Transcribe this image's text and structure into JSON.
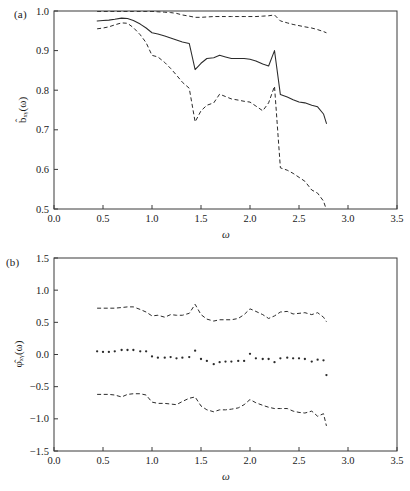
{
  "figure": {
    "panel_a_tag": "(a)",
    "panel_b_tag": "(b)",
    "xlabel": "ω",
    "ylabel_a": "b̂ₓᵧ(ω)",
    "ylabel_b": "φ̂ₓᵧ(ω)",
    "line_color": "#2b2b2b",
    "frame_color": "#3a3a3a",
    "background": "#ffffff"
  },
  "chart_data": [
    {
      "type": "line",
      "panel": "(a)",
      "title": "",
      "xlabel": "ω",
      "ylabel": "b̂_xy(ω)",
      "xlim": [
        0.0,
        3.5
      ],
      "ylim": [
        0.5,
        1.0
      ],
      "xticks": [
        0.0,
        0.5,
        1.0,
        1.5,
        2.0,
        2.5,
        3.0,
        3.5
      ],
      "xticklabels": [
        "0.0",
        "0.5",
        "1.0",
        "1.5",
        "2.0",
        "2.5",
        "3.0",
        "3.5"
      ],
      "yticks": [
        0.5,
        0.6,
        0.7,
        0.8,
        0.9,
        1.0
      ],
      "yticklabels": [
        "0.5",
        "0.6",
        "0.7",
        "0.8",
        "0.9",
        "1.0"
      ],
      "grid": false,
      "legend": "none",
      "series": [
        {
          "name": "upper confidence band",
          "style": "dashed",
          "x": [
            0.44,
            0.5,
            0.56,
            0.62,
            0.69,
            0.75,
            0.81,
            0.88,
            0.94,
            1.0,
            1.06,
            1.13,
            1.19,
            1.25,
            1.31,
            1.38,
            1.44,
            1.5,
            1.56,
            1.63,
            1.69,
            1.75,
            1.81,
            1.88,
            1.94,
            2.0,
            2.06,
            2.13,
            2.19,
            2.25,
            2.31,
            2.38,
            2.44,
            2.5,
            2.56,
            2.63,
            2.69,
            2.75,
            2.78
          ],
          "y": [
            0.999,
            0.999,
            0.999,
            0.999,
            0.999,
            0.999,
            0.999,
            0.999,
            0.999,
            0.999,
            0.998,
            0.997,
            0.996,
            0.994,
            0.99,
            0.987,
            0.984,
            0.984,
            0.985,
            0.986,
            0.986,
            0.986,
            0.986,
            0.986,
            0.986,
            0.986,
            0.986,
            0.987,
            0.988,
            0.99,
            0.975,
            0.97,
            0.966,
            0.963,
            0.96,
            0.957,
            0.953,
            0.948,
            0.945
          ]
        },
        {
          "name": "point estimate",
          "style": "solid",
          "x": [
            0.44,
            0.5,
            0.56,
            0.62,
            0.69,
            0.75,
            0.81,
            0.88,
            0.94,
            1.0,
            1.06,
            1.13,
            1.19,
            1.25,
            1.31,
            1.38,
            1.44,
            1.5,
            1.56,
            1.63,
            1.69,
            1.75,
            1.81,
            1.88,
            1.94,
            2.0,
            2.06,
            2.13,
            2.19,
            2.25,
            2.31,
            2.38,
            2.44,
            2.5,
            2.56,
            2.63,
            2.69,
            2.75,
            2.78
          ],
          "y": [
            0.975,
            0.976,
            0.977,
            0.979,
            0.982,
            0.981,
            0.976,
            0.967,
            0.957,
            0.945,
            0.942,
            0.937,
            0.932,
            0.927,
            0.922,
            0.918,
            0.852,
            0.868,
            0.88,
            0.882,
            0.888,
            0.884,
            0.88,
            0.88,
            0.88,
            0.878,
            0.874,
            0.866,
            0.861,
            0.9,
            0.789,
            0.783,
            0.776,
            0.77,
            0.768,
            0.762,
            0.758,
            0.74,
            0.716
          ]
        },
        {
          "name": "lower confidence band",
          "style": "dashed",
          "x": [
            0.44,
            0.5,
            0.56,
            0.62,
            0.69,
            0.75,
            0.81,
            0.88,
            0.94,
            1.0,
            1.06,
            1.13,
            1.19,
            1.25,
            1.31,
            1.38,
            1.44,
            1.5,
            1.56,
            1.63,
            1.69,
            1.75,
            1.81,
            1.88,
            1.94,
            2.0,
            2.06,
            2.13,
            2.19,
            2.25,
            2.31,
            2.38,
            2.44,
            2.5,
            2.56,
            2.63,
            2.69,
            2.75,
            2.78
          ],
          "y": [
            0.955,
            0.957,
            0.96,
            0.965,
            0.97,
            0.969,
            0.958,
            0.94,
            0.92,
            0.888,
            0.884,
            0.87,
            0.855,
            0.838,
            0.82,
            0.805,
            0.72,
            0.748,
            0.762,
            0.768,
            0.79,
            0.784,
            0.778,
            0.775,
            0.772,
            0.77,
            0.76,
            0.748,
            0.768,
            0.81,
            0.604,
            0.598,
            0.59,
            0.58,
            0.57,
            0.548,
            0.54,
            0.52,
            0.498
          ]
        }
      ]
    },
    {
      "type": "scatter",
      "panel": "(b)",
      "title": "",
      "xlabel": "ω",
      "ylabel": "φ̂_xy(ω)",
      "xlim": [
        0.0,
        3.5
      ],
      "ylim": [
        -1.5,
        1.5
      ],
      "xticks": [
        0.0,
        0.5,
        1.0,
        1.5,
        2.0,
        2.5,
        3.0,
        3.5
      ],
      "xticklabels": [
        "0.0",
        "0.5",
        "1.0",
        "1.5",
        "2.0",
        "2.5",
        "3.0",
        "3.5"
      ],
      "yticks": [
        -1.5,
        -1.0,
        -0.5,
        0.0,
        0.5,
        1.0,
        1.5
      ],
      "yticklabels": [
        "−1.5",
        "−1.0",
        "−0.5",
        "0.0",
        "0.5",
        "1.0",
        "1.5"
      ],
      "grid": false,
      "legend": "none",
      "series": [
        {
          "name": "upper confidence band",
          "style": "dashed",
          "x": [
            0.44,
            0.5,
            0.56,
            0.62,
            0.69,
            0.75,
            0.81,
            0.88,
            0.94,
            1.0,
            1.06,
            1.13,
            1.19,
            1.25,
            1.31,
            1.38,
            1.44,
            1.5,
            1.56,
            1.63,
            1.69,
            1.75,
            1.81,
            1.88,
            1.94,
            2.0,
            2.06,
            2.13,
            2.19,
            2.25,
            2.31,
            2.38,
            2.44,
            2.5,
            2.56,
            2.63,
            2.69,
            2.75,
            2.78
          ],
          "y": [
            0.72,
            0.72,
            0.72,
            0.72,
            0.73,
            0.74,
            0.74,
            0.7,
            0.66,
            0.6,
            0.61,
            0.58,
            0.62,
            0.61,
            0.61,
            0.64,
            0.78,
            0.62,
            0.55,
            0.52,
            0.54,
            0.54,
            0.54,
            0.56,
            0.62,
            0.71,
            0.67,
            0.62,
            0.56,
            0.6,
            0.66,
            0.67,
            0.63,
            0.64,
            0.65,
            0.62,
            0.65,
            0.58,
            0.51
          ]
        },
        {
          "name": "phase estimate",
          "style": "points",
          "x": [
            0.44,
            0.5,
            0.56,
            0.62,
            0.69,
            0.75,
            0.81,
            0.88,
            0.94,
            1.0,
            1.06,
            1.13,
            1.19,
            1.25,
            1.31,
            1.38,
            1.44,
            1.5,
            1.56,
            1.63,
            1.69,
            1.75,
            1.81,
            1.88,
            1.94,
            2.0,
            2.06,
            2.13,
            2.19,
            2.25,
            2.31,
            2.38,
            2.44,
            2.5,
            2.56,
            2.63,
            2.69,
            2.75,
            2.78
          ],
          "y": [
            0.05,
            0.04,
            0.04,
            0.05,
            0.07,
            0.07,
            0.07,
            0.05,
            0.05,
            -0.03,
            -0.05,
            -0.05,
            -0.04,
            -0.06,
            -0.05,
            -0.04,
            0.06,
            -0.07,
            -0.1,
            -0.15,
            -0.12,
            -0.11,
            -0.11,
            -0.1,
            -0.1,
            0.01,
            -0.06,
            -0.07,
            -0.07,
            -0.12,
            -0.06,
            -0.05,
            -0.06,
            -0.06,
            -0.07,
            -0.11,
            -0.08,
            -0.09,
            -0.32
          ]
        },
        {
          "name": "lower confidence band",
          "style": "dashed",
          "x": [
            0.44,
            0.5,
            0.56,
            0.62,
            0.69,
            0.75,
            0.81,
            0.88,
            0.94,
            1.0,
            1.06,
            1.13,
            1.19,
            1.25,
            1.31,
            1.38,
            1.44,
            1.5,
            1.56,
            1.63,
            1.69,
            1.75,
            1.81,
            1.88,
            1.94,
            2.0,
            2.06,
            2.13,
            2.19,
            2.25,
            2.31,
            2.38,
            2.44,
            2.5,
            2.56,
            2.63,
            2.69,
            2.75,
            2.78
          ],
          "y": [
            -0.62,
            -0.62,
            -0.62,
            -0.63,
            -0.66,
            -0.62,
            -0.61,
            -0.61,
            -0.63,
            -0.74,
            -0.76,
            -0.76,
            -0.77,
            -0.78,
            -0.73,
            -0.68,
            -0.66,
            -0.8,
            -0.86,
            -0.89,
            -0.86,
            -0.86,
            -0.85,
            -0.83,
            -0.78,
            -0.7,
            -0.75,
            -0.79,
            -0.82,
            -0.84,
            -0.84,
            -0.84,
            -0.88,
            -0.9,
            -0.91,
            -0.88,
            -0.96,
            -0.92,
            -1.11
          ]
        }
      ]
    }
  ]
}
